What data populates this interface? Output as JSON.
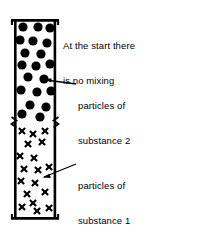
{
  "figure": {
    "background": "#ffffff",
    "ink": "#000000",
    "width": 221,
    "height": 235
  },
  "labels": {
    "intro_line1": "At the start there",
    "intro_line2": "is no mixing",
    "substance2_line1": "particles of",
    "substance2_line2": "substance 2",
    "substance1_line1": "particles of",
    "substance1_line2": "substance 1"
  },
  "tube": {
    "name": "vertical-tube",
    "left": 14,
    "right": 56,
    "top": 20,
    "bottom": 219,
    "wall_width": 2.6,
    "rim_top_left": 11,
    "rim_top_right": 59,
    "rim_bottom_left": 11,
    "rim_bottom_right": 59,
    "divider_y": 122
  },
  "chart_data": {
    "type": "scatter",
    "title": "At the start there is no mixing",
    "xlabel": "",
    "ylabel": "",
    "xlim": [
      14,
      56
    ],
    "ylim": [
      20,
      219
    ],
    "grid": false,
    "legend": "inline-leader-labels",
    "series": [
      {
        "name": "particles of substance 2",
        "marker": "filled-circle",
        "marker_size": 4.6,
        "color": "#000000",
        "count": 17,
        "region": "upper half of tube (y 20 to 122)",
        "points": [
          [
            23,
            27
          ],
          [
            38,
            27
          ],
          [
            50,
            28
          ],
          [
            20,
            40
          ],
          [
            33,
            41
          ],
          [
            47,
            43
          ],
          [
            25,
            53
          ],
          [
            41,
            54
          ],
          [
            22,
            65
          ],
          [
            36,
            66
          ],
          [
            50,
            64
          ],
          [
            28,
            77
          ],
          [
            44,
            79
          ],
          [
            21,
            90
          ],
          [
            37,
            92
          ],
          [
            51,
            91
          ],
          [
            30,
            105
          ],
          [
            46,
            107
          ],
          [
            22,
            114
          ],
          [
            40,
            117
          ]
        ]
      },
      {
        "name": "particles of substance 1",
        "marker": "cross-x",
        "marker_size": 5.0,
        "color": "#000000",
        "count": 18,
        "region": "lower half of tube (y 122 to 219)",
        "points": [
          [
            22,
            131
          ],
          [
            33,
            134
          ],
          [
            45,
            131
          ],
          [
            28,
            144
          ],
          [
            42,
            142
          ],
          [
            20,
            156
          ],
          [
            34,
            158
          ],
          [
            24,
            169
          ],
          [
            38,
            170
          ],
          [
            49,
            167
          ],
          [
            21,
            181
          ],
          [
            35,
            183
          ],
          [
            27,
            194
          ],
          [
            45,
            192
          ],
          [
            22,
            207
          ],
          [
            33,
            203
          ],
          [
            37,
            211
          ],
          [
            49,
            208
          ]
        ]
      }
    ],
    "annotations": [
      {
        "text": "At the start there is no mixing",
        "anchor_x": 63,
        "anchor_y": 17,
        "leader": false
      },
      {
        "text": "particles of substance 2",
        "anchor_x": 78,
        "anchor_y": 77,
        "leader": true,
        "leader_from": [
          76,
          84
        ],
        "leader_to": [
          44,
          79
        ]
      },
      {
        "text": "particles of substance 1",
        "anchor_x": 78,
        "anchor_y": 157,
        "leader": true,
        "leader_from": [
          76,
          164
        ],
        "leader_to": [
          42,
          176
        ]
      }
    ]
  }
}
